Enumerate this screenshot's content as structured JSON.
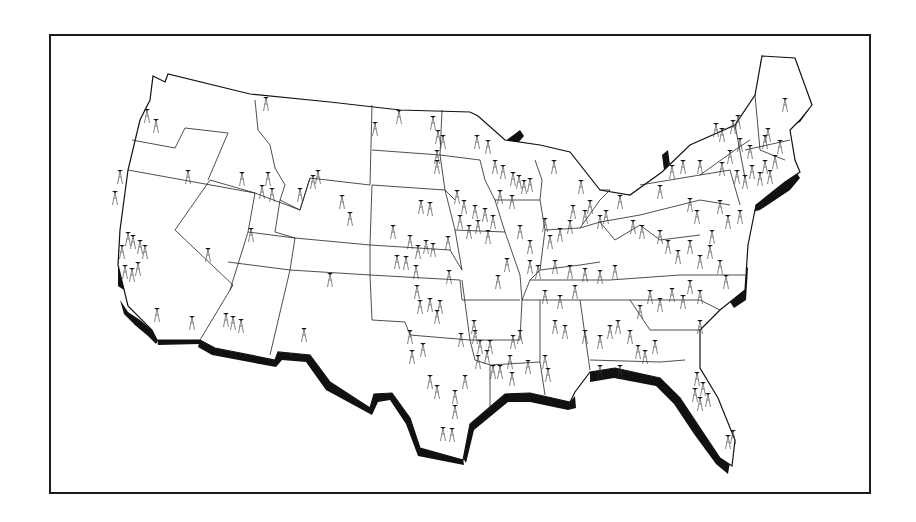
{
  "figure": {
    "title": "",
    "description": "Map of the continental United States showing station/tower locations",
    "colors": {
      "ink": "#111111",
      "paper": "#ffffff",
      "frame": "#1a1a1a"
    }
  },
  "map": {
    "region": "Continental United States",
    "marker_symbol": "tower-icon",
    "has_labels": false,
    "coastline_shading": "south and east coasts drawn with heavy black shadow"
  }
}
